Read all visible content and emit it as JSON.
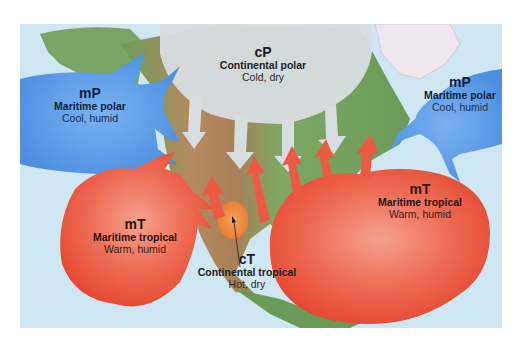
{
  "colors": {
    "ocean": "#cfe6f3",
    "land_green": "#6f9e5c",
    "land_brown": "#b88a5c",
    "polar_continental": "#d7dde0",
    "maritime_polar": "#5b9be6",
    "maritime_tropical": "#ee5a45",
    "continental_tropical": "#ef8a3c"
  },
  "air_masses": [
    {
      "id": "cP",
      "code": "cP",
      "name": "Continental polar",
      "description": "Cold, dry",
      "color": "#d7dde0"
    },
    {
      "id": "mP-pacific",
      "code": "mP",
      "name": "Maritime polar",
      "description": "Cool, humid",
      "color": "#5b9be6"
    },
    {
      "id": "mP-atlantic",
      "code": "mP",
      "name": "Maritime polar",
      "description": "Cool, humid",
      "color": "#5b9be6"
    },
    {
      "id": "mT-pacific",
      "code": "mT",
      "name": "Maritime tropical",
      "description": "Warm, humid",
      "color": "#ee5a45"
    },
    {
      "id": "cT",
      "code": "cT",
      "name": "Continental tropical",
      "description": "Hot, dry",
      "color": "#ef8a3c"
    },
    {
      "id": "mT-atlantic",
      "code": "mT",
      "name": "Maritime tropical",
      "description": "Warm, humid",
      "color": "#ee5a45"
    }
  ]
}
